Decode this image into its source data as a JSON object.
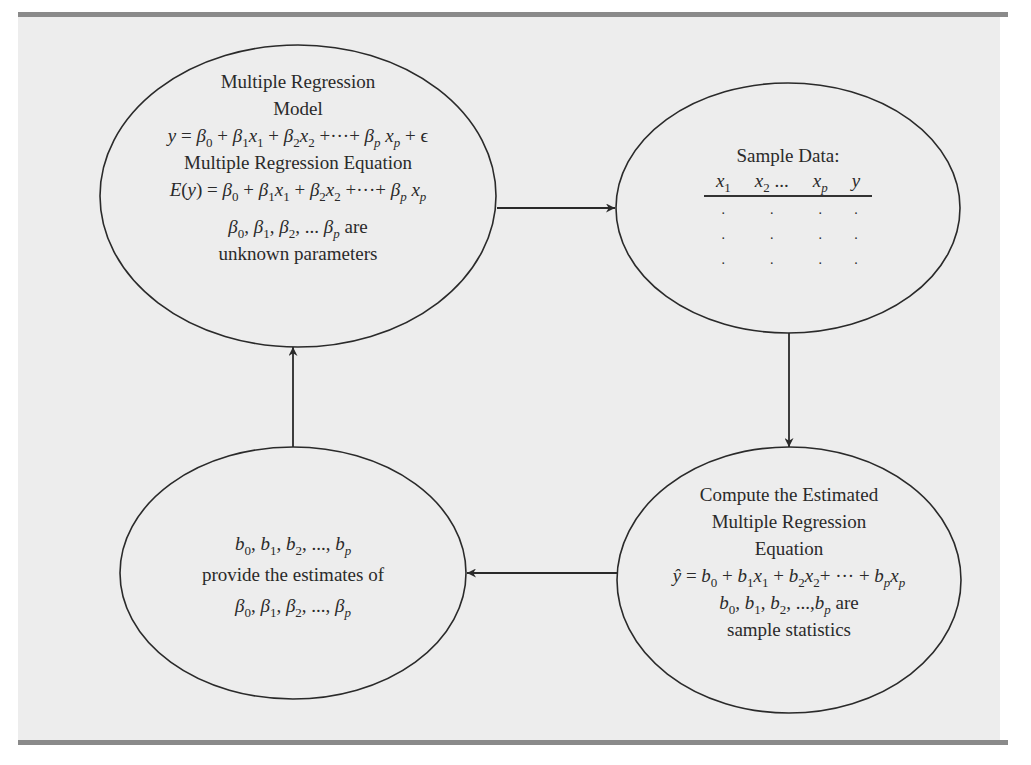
{
  "diagram": {
    "colors": {
      "panel": "#ededed",
      "rule": "#8a8a8a",
      "stroke": "#2a2a2a"
    },
    "nodes": {
      "model": {
        "heading_1": "Multiple Regression",
        "heading_2": "Model",
        "model_eq": "y = β0 + β1x1 + β2x2 + ··· + βpxp + ϵ",
        "equation_heading": "Multiple Regression Equation",
        "expected_eq": "E(y) = β0 + β1x1 + β2x2 + ··· + βpxp",
        "params": "β0, β1, β2, ... βp are",
        "params_note": "unknown parameters",
        "are_word": "are"
      },
      "sample": {
        "heading": "Sample Data:",
        "columns": [
          "x1",
          "x2 ...",
          "xp",
          "y"
        ],
        "rows": [
          [
            ".",
            ".",
            ".",
            "."
          ],
          [
            ".",
            ".",
            ".",
            "."
          ],
          [
            ".",
            ".",
            ".",
            "."
          ]
        ]
      },
      "compute": {
        "heading_1": "Compute the Estimated",
        "heading_2": "Multiple Regression",
        "heading_3": "Equation",
        "estimated_eq": "ŷ = b0 + b1x1 + b2x2 + ··· + bpxp",
        "stats": "b0, b1, b2, ..., bp are",
        "stats_note": "sample statistics",
        "are_word": "are"
      },
      "estimates": {
        "coefficients": "b0, b1, b2, ..., bp",
        "text": "provide the estimates of",
        "parameters": "β0, β1, β2, ..., βp"
      }
    },
    "edges": [
      {
        "from": "model",
        "to": "sample",
        "direction": "right"
      },
      {
        "from": "sample",
        "to": "compute",
        "direction": "down"
      },
      {
        "from": "compute",
        "to": "estimates",
        "direction": "left"
      },
      {
        "from": "estimates",
        "to": "model",
        "direction": "up"
      }
    ],
    "symbols": {
      "plus": "+",
      "eq": "=",
      "dots": "···",
      "ellipsis": "...",
      "comma": ",",
      "beta": "β",
      "b": "b",
      "x": "x",
      "y": "y",
      "yhat": "ŷ",
      "E": "E",
      "epsilon": "ϵ",
      "s0": "0",
      "s1": "1",
      "s2": "2",
      "sp": "p",
      "lp": "(",
      "rp": ")"
    }
  }
}
